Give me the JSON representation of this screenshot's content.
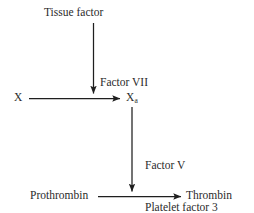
{
  "diagram": {
    "type": "flow-diagram",
    "line_color": "#1f1f1f",
    "text_color": "#2b2b2b",
    "background": "#ffffff",
    "nodes": [
      {
        "id": "tissue-factor",
        "label": "Tissue factor"
      },
      {
        "id": "factor-x",
        "label": "X"
      },
      {
        "id": "factor-xa",
        "label": "X",
        "subscript": "a"
      },
      {
        "id": "prothrombin",
        "label": "Prothrombin"
      },
      {
        "id": "thrombin",
        "label": "Thrombin"
      }
    ],
    "edge_labels": [
      {
        "id": "factor-vii",
        "line1": "Factor VII"
      },
      {
        "id": "factor-v-pf3",
        "line1": "Factor V",
        "line2": "Platelet factor 3"
      }
    ],
    "edges": [
      {
        "id": "tissue-factor-to-x-arrow",
        "from": "tissue-factor",
        "to": "factor-x-arrow",
        "direction": "down"
      },
      {
        "id": "x-to-xa-arrow",
        "from": "factor-x",
        "to": "factor-xa",
        "direction": "right"
      },
      {
        "id": "xa-to-prothrombin-arrow",
        "from": "factor-xa",
        "to": "prothrombin-arrow",
        "direction": "down"
      },
      {
        "id": "prothrombin-to-thrombin-arrow",
        "from": "prothrombin",
        "to": "thrombin",
        "direction": "right"
      }
    ]
  }
}
